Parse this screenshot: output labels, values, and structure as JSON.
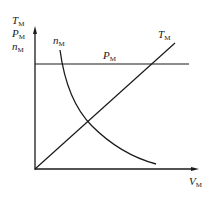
{
  "diagram": {
    "type": "characteristic-curves",
    "y_axis_labels": [
      {
        "main": "T",
        "sub": "M"
      },
      {
        "main": "P",
        "sub": "M"
      },
      {
        "main": "n",
        "sub": "M"
      }
    ],
    "x_axis_label": {
      "main": "V",
      "sub": "M"
    },
    "curves": [
      {
        "name": "T_M",
        "label_main": "T",
        "label_sub": "M",
        "shape": "straight line rising from origin"
      },
      {
        "name": "P_M",
        "label_main": "P",
        "label_sub": "M",
        "shape": "horizontal constant line"
      },
      {
        "name": "n_M",
        "label_main": "n",
        "label_sub": "M",
        "shape": "hyperbolic decreasing curve"
      }
    ],
    "colors": {
      "line": "#1a1a1a",
      "background": "#ffffff"
    }
  }
}
